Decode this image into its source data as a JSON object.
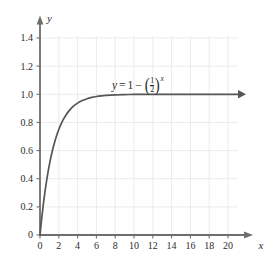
{
  "figure": {
    "background": "#ffffff",
    "curve_color": "#555555",
    "axis_color": "#6e6e6e",
    "grid_color": "#e2e2e6",
    "text_color": "#2b2b2b"
  },
  "equation": {
    "lhs": "y",
    "equals": "=",
    "one": "1",
    "minus": "−",
    "paren_open": "(",
    "paren_close": ")",
    "numerator": "1",
    "denominator": "2",
    "exponent": "x",
    "plain": "y = 1 - (1/2)^x"
  },
  "axes": {
    "x_name": "x",
    "y_name": "y",
    "x_ticks": [
      "0",
      "2",
      "4",
      "6",
      "8",
      "10",
      "12",
      "14",
      "16",
      "18",
      "20"
    ],
    "y_ticks": [
      "0",
      "0.2",
      "0.4",
      "0.6",
      "0.8",
      "1.0",
      "1.2",
      "1.4"
    ]
  },
  "chart_data": {
    "type": "line",
    "title": "",
    "xlabel": "x",
    "ylabel": "y",
    "xlim": [
      0,
      21.5
    ],
    "ylim": [
      0,
      1.5
    ],
    "grid": true,
    "legend": null,
    "annotations": [
      {
        "text": "y = 1 - (1/2)^x",
        "x": 7.8,
        "y": 1.12
      }
    ],
    "x_tick_values": [
      0,
      2,
      4,
      6,
      8,
      10,
      12,
      14,
      16,
      18,
      20
    ],
    "y_tick_values": [
      0,
      0.2,
      0.4,
      0.6,
      0.8,
      1.0,
      1.2,
      1.4
    ],
    "series": [
      {
        "name": "y = 1 - (1/2)^x",
        "color": "#555555",
        "arrow_end": true,
        "x": [
          0,
          0.1,
          0.2,
          0.3,
          0.4,
          0.5,
          0.6,
          0.8,
          1.0,
          1.2,
          1.4,
          1.6,
          1.8,
          2.0,
          2.25,
          2.5,
          2.75,
          3.0,
          3.5,
          4.0,
          4.5,
          5.0,
          5.5,
          6.0,
          6.5,
          7.0,
          8.0,
          9.0,
          10.0,
          11.0,
          12.0,
          13.0,
          14.0,
          15.0,
          16.0,
          17.0,
          18.0,
          19.0,
          20.0,
          21.0,
          22.0
        ],
        "values": [
          0,
          0.067,
          0.1294,
          0.1877,
          0.2421,
          0.2929,
          0.3403,
          0.4257,
          0.5,
          0.5647,
          0.6213,
          0.6704,
          0.7131,
          0.75,
          0.7899,
          0.8232,
          0.8513,
          0.875,
          0.9116,
          0.9375,
          0.9558,
          0.9688,
          0.9779,
          0.9844,
          0.989,
          0.9922,
          0.9961,
          0.998,
          0.999,
          0.9995,
          0.9998,
          0.9999,
          0.9999,
          1.0,
          1.0,
          1.0,
          1.0,
          1.0,
          1.0,
          1.0,
          1.0
        ]
      }
    ]
  }
}
